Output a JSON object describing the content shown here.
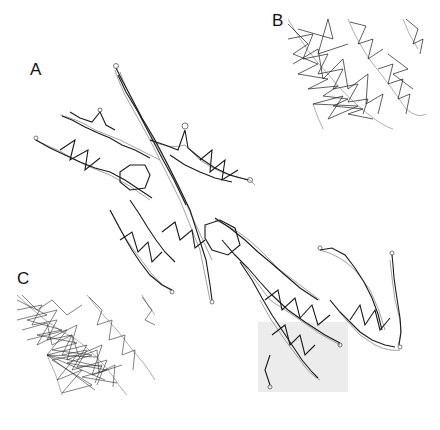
{
  "figure": {
    "panels": [
      {
        "id": "A",
        "label": "A",
        "description": "Full network graph overlaid on segmented cell outline (elongated, branched structure running diagonally from upper-left to lower-right)"
      },
      {
        "id": "B",
        "label": "B",
        "description": "Zoomed detail of dense network edges within outline"
      },
      {
        "id": "C",
        "label": "C",
        "description": "Zoomed detail showing very dense overlapping network edges"
      }
    ],
    "highlight_region": {
      "panel": "A",
      "color": "#eeeeee",
      "description": "Gray shaded region marking the zoomed area"
    },
    "colors": {
      "edges": "#1a1a1a",
      "outline": "#8a8a8a",
      "highlight": "#ececec",
      "background": "#ffffff"
    }
  }
}
